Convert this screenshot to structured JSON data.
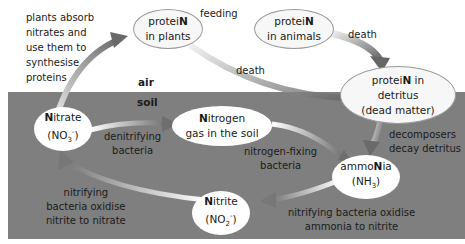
{
  "zones": {
    "air_label": "air",
    "soil_label": "soil",
    "soil_color": "#7f7f7f"
  },
  "nodes": {
    "protein_plants": {
      "pre": "protei",
      "bold": "N",
      "post": "",
      "line2": "in plants"
    },
    "protein_animals": {
      "pre": "protei",
      "bold": "N",
      "post": "",
      "line2": "in animals"
    },
    "protein_detritus": {
      "pre": "protei",
      "bold": "N",
      "post": " in",
      "line2": "detritus",
      "line3": "(dead matter)"
    },
    "nitrate": {
      "pre": "",
      "bold": "N",
      "post": "itrate",
      "formula_base": "(NO",
      "formula_sub": "3",
      "formula_sup": "-",
      "formula_end": ")"
    },
    "nitrogen_gas": {
      "pre": "",
      "bold": "N",
      "post": "itrogen",
      "line2": "gas in the soil"
    },
    "ammonia": {
      "pre": "ammo",
      "bold": "N",
      "post": "ia",
      "formula_base": "(NH",
      "formula_sub": "3",
      "formula_end": ")"
    },
    "nitrite": {
      "pre": "",
      "bold": "N",
      "post": "itrite",
      "formula_base": "(NO",
      "formula_sub": "2",
      "formula_sup": "-",
      "formula_end": ")"
    }
  },
  "labels": {
    "plants_absorb": [
      "plants absorb",
      "nitrates and",
      "use them to",
      "synthesise",
      "proteins"
    ],
    "feeding": "feeding",
    "death_animals": "death",
    "death_plants": "death",
    "denitrifying": [
      "denitrifying",
      "bacteria"
    ],
    "nitrogen_fixing": [
      "nitrogen-fixing",
      "bacteria"
    ],
    "decomposers": [
      "decomposers",
      "decay detritus"
    ],
    "nitrifying_ammonia": [
      "nitrifying bacteria oxidise",
      "ammonia to nitrite"
    ],
    "nitrifying_nitrite": [
      "nitrifying",
      "bacteria oxidise",
      "nitrite to nitrate"
    ]
  }
}
